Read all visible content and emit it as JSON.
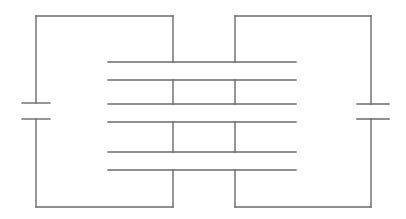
{
  "diagram": {
    "type": "circuit-schematic",
    "stroke_color": "#6b6b6b",
    "outer_loops": [
      {
        "side": "left",
        "x": 36,
        "top_y": 16,
        "bottom_y": 207,
        "inner_x": 173,
        "capacitor": {
          "plate_y": [
            103,
            119
          ],
          "plate_x": [
            22,
            50
          ]
        }
      },
      {
        "side": "right",
        "x": 371,
        "top_y": 16,
        "bottom_y": 207,
        "inner_x": 235,
        "capacitor": {
          "plate_y": [
            104,
            119
          ],
          "plate_x": [
            357,
            389
          ]
        }
      }
    ],
    "plates": {
      "count": 6,
      "x_start": 108,
      "x_end": 296,
      "y": [
        62,
        80,
        104,
        122,
        152,
        170
      ]
    },
    "plate_connectors": [
      {
        "x": 173,
        "from_y": 80,
        "to_y": 104
      },
      {
        "x": 173,
        "from_y": 122,
        "to_y": 152
      },
      {
        "x": 235,
        "from_y": 80,
        "to_y": 104
      },
      {
        "x": 235,
        "from_y": 122,
        "to_y": 152
      }
    ]
  }
}
